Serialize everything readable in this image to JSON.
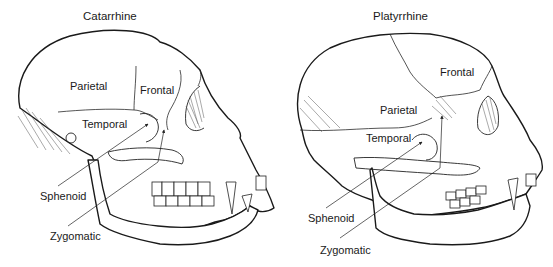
{
  "diagram": {
    "panels": [
      {
        "title": "Catarrhine",
        "labels": {
          "parietal": "Parietal",
          "frontal": "Frontal",
          "temporal": "Temporal",
          "sphenoid": "Sphenoid",
          "zygomatic": "Zygomatic"
        }
      },
      {
        "title": "Platyrrhine",
        "labels": {
          "parietal": "Parietal",
          "frontal": "Frontal",
          "temporal": "Temporal",
          "sphenoid": "Sphenoid",
          "zygomatic": "Zygomatic"
        }
      }
    ]
  }
}
